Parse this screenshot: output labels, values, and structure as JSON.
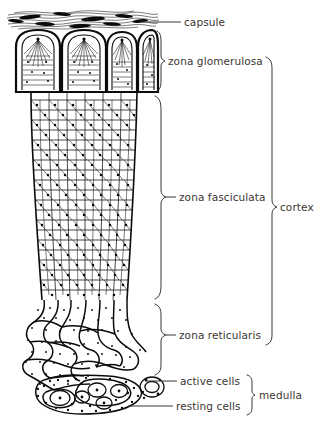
{
  "figure": {
    "background_color": "#ffffff",
    "ink_color": "#0d0b0a",
    "label_color": "#3b3632"
  },
  "labels": {
    "capsule": "capsule",
    "zona_glomerulosa": "zona glomerulosa",
    "zona_fasciculata": "zona fasciculata",
    "zona_reticularis": "zona reticularis",
    "cortex": "cortex",
    "active_cells": "active cells",
    "resting_cells": "resting cells",
    "medulla": "medulla"
  },
  "annotations": [
    {
      "id": "capsule",
      "label": "capsule",
      "type": "leader-line",
      "text_x": 184,
      "text_y": 26,
      "line_from_x": 139,
      "line_from_y": 22,
      "line_to_x": 181,
      "line_to_y": 22
    },
    {
      "id": "zona-glomerulosa",
      "label": "zona glomerulosa",
      "type": "bracket",
      "text_x": 172,
      "text_y": 65,
      "bracket_x": 160,
      "bracket_top": 30,
      "bracket_bottom": 91,
      "bracket_mid": 61
    },
    {
      "id": "zona-fasciculata",
      "label": "zona fasciculata",
      "type": "bracket",
      "text_x": 180,
      "text_y": 199,
      "bracket_x": 160,
      "bracket_top": 96,
      "bracket_bottom": 299,
      "bracket_mid": 197
    },
    {
      "id": "zona-reticularis",
      "label": "zona reticularis",
      "type": "bracket",
      "text_x": 180,
      "text_y": 337,
      "bracket_x": 160,
      "bracket_top": 303,
      "bracket_bottom": 375,
      "bracket_mid": 335
    },
    {
      "id": "cortex",
      "label": "cortex",
      "type": "bracket",
      "text_x": 281,
      "text_y": 211,
      "bracket_x": 272,
      "bracket_top": 56,
      "bracket_bottom": 345,
      "bracket_mid": 207
    },
    {
      "id": "active-cells",
      "label": "active cells",
      "type": "leader-line",
      "text_x": 180,
      "text_y": 385,
      "line_from_x": 146,
      "line_from_y": 381,
      "line_to_x": 177,
      "line_to_y": 381
    },
    {
      "id": "resting-cells",
      "label": "resting cells",
      "type": "leader-line",
      "text_x": 176,
      "text_y": 411,
      "line_from_x": 129,
      "line_from_y": 405,
      "line_to_x": 173,
      "line_to_y": 405
    },
    {
      "id": "medulla",
      "label": "medulla",
      "type": "bracket",
      "text_x": 262,
      "text_y": 399,
      "bracket_x": 252,
      "bracket_top": 374,
      "bracket_bottom": 415,
      "bracket_mid": 395
    }
  ],
  "regions": [
    {
      "name": "capsule",
      "description": "dense fibrous connective tissue band of wavy dark fibres across the top of the gland",
      "y_from": 10,
      "y_to": 28
    },
    {
      "name": "zona glomerulosa",
      "description": "four rounded arched cell clusters with radiating fan-like hatching, directly beneath the capsule",
      "y_from": 28,
      "y_to": 92
    },
    {
      "name": "zona fasciculata",
      "description": "long parallel vertical cords of polygonal cells with dark central nuclei, forming the tapering column",
      "y_from": 92,
      "y_to": 300
    },
    {
      "name": "zona reticularis",
      "description": "anastomosing branching network of stippled cell cords",
      "y_from": 300,
      "y_to": 372
    },
    {
      "name": "medulla",
      "description": "clusters of large pale chromaffin cells (active) and small dark cells (resting)",
      "y_from": 362,
      "y_to": 420
    }
  ]
}
